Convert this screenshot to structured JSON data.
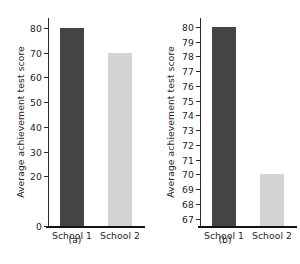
{
  "figure": {
    "background": "#ffffff",
    "dark_color": "#454545",
    "light_color": "#d4d4d4",
    "axis_color": "#2b2b2b"
  },
  "chart_data": [
    {
      "type": "bar",
      "panel": "a",
      "caption": "(a)",
      "title": "",
      "xlabel": "",
      "ylabel": "Average achievement test score",
      "categories": [
        "School 1",
        "School 2"
      ],
      "values": [
        80,
        70
      ],
      "bar_colors": [
        "#454545",
        "#d4d4d4"
      ],
      "ylim": [
        0,
        84
      ],
      "yticks": [
        0,
        20,
        30,
        40,
        50,
        60,
        70,
        80
      ],
      "ytick_labels": [
        "0",
        "20",
        "30",
        "40",
        "50",
        "60",
        "70",
        "80"
      ],
      "grid": false,
      "legend": "none"
    },
    {
      "type": "bar",
      "panel": "b",
      "caption": "(b)",
      "title": "",
      "xlabel": "",
      "ylabel": "Average achievement test score",
      "categories": [
        "School 1",
        "School 2"
      ],
      "values": [
        80,
        70
      ],
      "bar_colors": [
        "#454545",
        "#d4d4d4"
      ],
      "ylim": [
        66.5,
        80.6
      ],
      "yticks": [
        67,
        68,
        69,
        70,
        71,
        72,
        73,
        74,
        75,
        76,
        77,
        78,
        79,
        80
      ],
      "ytick_labels": [
        "67",
        "68",
        "69",
        "70",
        "71",
        "72",
        "73",
        "74",
        "75",
        "76",
        "77",
        "78",
        "79",
        "80"
      ],
      "grid": false,
      "legend": "none"
    }
  ]
}
